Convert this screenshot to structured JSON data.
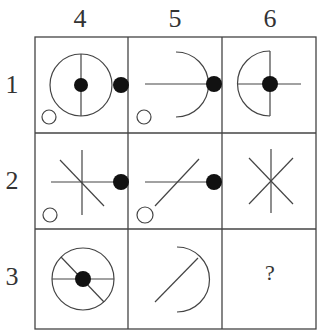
{
  "columns": [
    "4",
    "5",
    "6"
  ],
  "rows": [
    "1",
    "2",
    "3"
  ],
  "colors": {
    "line": "#444444",
    "fill": "#111111"
  },
  "cells": [
    {
      "row": "1",
      "col": "4",
      "description": "circle with vertical diameter, black center dot, black dot on right edge, small open circle bottom-left"
    },
    {
      "row": "1",
      "col": "5",
      "description": "right half-arc with horizontal radius, black dot on right edge, small open circle bottom-left"
    },
    {
      "row": "1",
      "col": "6",
      "description": "left half-arc with vertical line, horizontal line, black center dot"
    },
    {
      "row": "2",
      "col": "4",
      "description": "vertical, horizontal and diagonal lines crossing, black dot on right edge, small open circle bottom-left"
    },
    {
      "row": "2",
      "col": "5",
      "description": "horizontal line and diagonal line, black dot on right edge, small open circle bottom-left"
    },
    {
      "row": "2",
      "col": "6",
      "description": "six-pointed asterisk of lines"
    },
    {
      "row": "3",
      "col": "4",
      "description": "circle with horizontal diameter, diagonal line, black center dot"
    },
    {
      "row": "3",
      "col": "5",
      "description": "right half-arc with diagonal line"
    },
    {
      "row": "3",
      "col": "6",
      "description": "question mark",
      "label": "?"
    }
  ]
}
